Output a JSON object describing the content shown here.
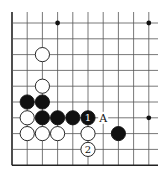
{
  "diagram": {
    "grid": {
      "columns": 10,
      "rows": 10,
      "x0": 12,
      "y0": 23,
      "dx": 15.2,
      "dy": 15.8,
      "edges": [
        "left",
        "bottom"
      ],
      "line_color": "#555555",
      "edge_color": "#222222"
    },
    "star_points": [
      {
        "col": 3,
        "row": 0
      },
      {
        "col": 9,
        "row": 0
      },
      {
        "col": 9,
        "row": 6
      }
    ],
    "stones": [
      {
        "color": "white",
        "col": 2,
        "row": 2
      },
      {
        "color": "white",
        "col": 2,
        "row": 4
      },
      {
        "color": "black",
        "col": 1,
        "row": 5
      },
      {
        "color": "black",
        "col": 2,
        "row": 5
      },
      {
        "color": "white",
        "col": 1,
        "row": 6
      },
      {
        "color": "black",
        "col": 2,
        "row": 6
      },
      {
        "color": "black",
        "col": 3,
        "row": 6
      },
      {
        "color": "black",
        "col": 4,
        "row": 6
      },
      {
        "color": "black",
        "col": 5,
        "row": 6,
        "label": "1"
      },
      {
        "color": "white",
        "col": 1,
        "row": 7
      },
      {
        "color": "white",
        "col": 2,
        "row": 7
      },
      {
        "color": "white",
        "col": 3,
        "row": 7
      },
      {
        "color": "white",
        "col": 5,
        "row": 7
      },
      {
        "color": "black",
        "col": 7,
        "row": 7
      },
      {
        "color": "white",
        "col": 5,
        "row": 8,
        "label": "2"
      }
    ],
    "point_labels": [
      {
        "col": 6,
        "row": 6,
        "text": "A"
      }
    ]
  }
}
